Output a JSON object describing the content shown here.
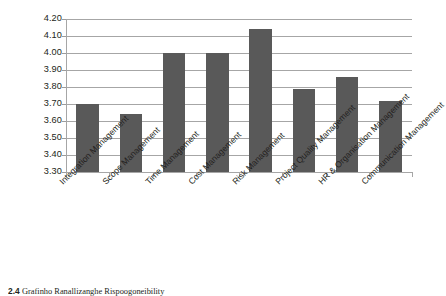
{
  "chart_data": {
    "type": "bar",
    "title": "",
    "subtitle": "",
    "xlabel": "",
    "ylabel": "",
    "ylim": [
      3.3,
      4.2
    ],
    "ytick_step": 0.1,
    "yticks": [
      "4.20",
      "4.10",
      "4.00",
      "3.90",
      "3.80",
      "3.70",
      "3.60",
      "3.50",
      "3.40",
      "3.30"
    ],
    "grid": "horizontal",
    "legend": "none",
    "bar_color": "#595959",
    "gridline_color": "#a6a6a6",
    "categories": [
      "Integration Management",
      "Scope Management",
      "Time Management",
      "Cost Management",
      "Risk Management",
      "Project Quality Management",
      "HR & Organisation Management",
      "Communication Management"
    ],
    "values": [
      3.7,
      3.64,
      4.0,
      4.0,
      4.14,
      3.79,
      3.86,
      3.72
    ]
  },
  "caption": {
    "number": "2.4",
    "text": "Grafinho Ranallizanghe Rispoogoneibility"
  }
}
